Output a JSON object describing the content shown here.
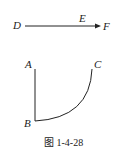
{
  "diagram": {
    "labels": {
      "D": "D",
      "E": "E",
      "F": "F",
      "A": "A",
      "B": "B",
      "C": "C"
    },
    "caption": "图 1-4-28",
    "stroke_color": "#222222"
  }
}
